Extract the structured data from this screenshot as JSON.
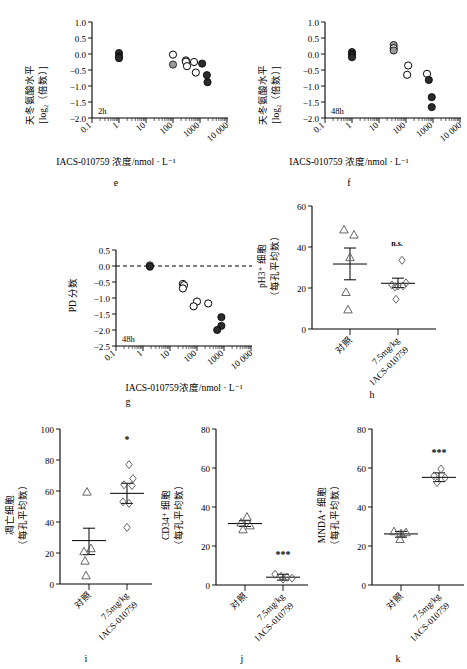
{
  "figure": {
    "panels": [
      "e",
      "f",
      "g",
      "h",
      "i",
      "j",
      "k"
    ]
  },
  "panel_e": {
    "letter": "e",
    "inline_label": "2h",
    "ylabel_line1": "天冬氨酸水平",
    "ylabel_line2": "[log₂（倍数）]",
    "xlabel": "IACS-010759 浓度/nmol · L⁻¹",
    "yticks": [
      "1.0",
      "0.5",
      "0.0",
      "−0.5",
      "−1.0",
      "−1.5",
      "−2.0"
    ],
    "xticks": [
      "0.1",
      "1",
      "10",
      "100",
      "1000",
      "10 000"
    ]
  },
  "panel_f": {
    "letter": "f",
    "inline_label": "48h",
    "ylabel_line1": "天冬氨酸水平",
    "ylabel_line2": "[log₂（倍数）]",
    "xlabel": "IACS-010759 浓度/nmol · L⁻¹",
    "yticks": [
      "1.0",
      "0.5",
      "0.0",
      "−0.5",
      "−1.0",
      "−1.5",
      "−2.0"
    ],
    "xticks": [
      "0.1",
      "1",
      "10",
      "100",
      "1000",
      "10 000"
    ]
  },
  "panel_g": {
    "letter": "g",
    "inline_label": "48h",
    "ylabel": "PD 分数",
    "xlabel": "IACS-010759浓度/nmol · L⁻¹",
    "yticks": [
      "0.5",
      "0.0",
      "−0.5",
      "−1.0",
      "−1.5",
      "−2.0",
      "−2.5"
    ],
    "xticks": [
      "0.1",
      "1",
      "10",
      "100",
      "1000",
      "10 000"
    ]
  },
  "panel_h": {
    "letter": "h",
    "ylabel_line1": "pH3⁺ 细胞",
    "ylabel_line2": "（每孔平均数）",
    "yticks": [
      "60",
      "40",
      "20",
      "0"
    ],
    "xticks": [
      "对照",
      "7.5mg/kg\nIACS-010759"
    ],
    "xtick1": "对照",
    "xtick2a": "7.5mg/kg",
    "xtick2b": "IACS-010759",
    "significance": "n.s."
  },
  "panel_i": {
    "letter": "i",
    "ylabel_line1": "凋亡细胞",
    "ylabel_line2": "（每孔平均数）",
    "yticks": [
      "100",
      "80",
      "60",
      "40",
      "20",
      "0"
    ],
    "xtick1": "对照",
    "xtick2a": "7.5mg/kg",
    "xtick2b": "IACS-010759",
    "significance": "*"
  },
  "panel_j": {
    "letter": "j",
    "ylabel_line1": "CD34⁺ 细胞",
    "ylabel_line2": "（每孔平均数）",
    "yticks": [
      "80",
      "60",
      "40",
      "20",
      "0"
    ],
    "xtick1": "对照",
    "xtick2a": "7.5mg/kg",
    "xtick2b": "IACS-010759",
    "significance": "***"
  },
  "panel_k": {
    "letter": "k",
    "ylabel_line1": "MNDA⁺ 细胞",
    "ylabel_line2": "（每孔平均数）",
    "yticks": [
      "80",
      "60",
      "40",
      "20",
      "0"
    ],
    "xtick1": "对照",
    "xtick2a": "7.5mg/kg",
    "xtick2b": "IACS-010759",
    "significance": "***"
  },
  "chart_data": [
    {
      "id": "e",
      "type": "scatter",
      "title": "",
      "xlabel": "IACS-010759 浓度/nmol · L⁻¹",
      "ylabel": "天冬氨酸水平 [log2(倍数)]",
      "annotation": "2h",
      "xscale": "log",
      "xlim": [
        0.1,
        10000
      ],
      "ylim": [
        -2.0,
        1.0
      ],
      "grid": false,
      "legend": "none",
      "points": [
        {
          "x": 1,
          "y": 0.03,
          "style": "dark"
        },
        {
          "x": 1,
          "y": -0.08,
          "style": "dark"
        },
        {
          "x": 1,
          "y": -0.13,
          "style": "dark"
        },
        {
          "x": 100,
          "y": -0.02,
          "style": "open"
        },
        {
          "x": 100,
          "y": -0.33,
          "style": "gray"
        },
        {
          "x": 300,
          "y": -0.2,
          "style": "open"
        },
        {
          "x": 300,
          "y": -0.24,
          "style": "open"
        },
        {
          "x": 330,
          "y": -0.38,
          "style": "open"
        },
        {
          "x": 600,
          "y": -0.25,
          "style": "open"
        },
        {
          "x": 700,
          "y": -0.58,
          "style": "open"
        },
        {
          "x": 1200,
          "y": -0.3,
          "style": "dark"
        },
        {
          "x": 1800,
          "y": -0.66,
          "style": "dark"
        },
        {
          "x": 1900,
          "y": -0.88,
          "style": "dark"
        }
      ]
    },
    {
      "id": "f",
      "type": "scatter",
      "title": "",
      "xlabel": "IACS-010759 浓度/nmol · L⁻¹",
      "ylabel": "天冬氨酸水平 [log2(倍数)]",
      "annotation": "48h",
      "xscale": "log",
      "xlim": [
        0.1,
        10000
      ],
      "ylim": [
        -2.0,
        1.0
      ],
      "grid": false,
      "legend": "none",
      "points": [
        {
          "x": 1,
          "y": 0.06,
          "style": "dark"
        },
        {
          "x": 1,
          "y": -0.02,
          "style": "dark"
        },
        {
          "x": 1,
          "y": -0.1,
          "style": "dark"
        },
        {
          "x": 35,
          "y": 0.28,
          "style": "gray"
        },
        {
          "x": 35,
          "y": 0.18,
          "style": "open"
        },
        {
          "x": 35,
          "y": 0.11,
          "style": "gray"
        },
        {
          "x": 120,
          "y": -0.36,
          "style": "open"
        },
        {
          "x": 110,
          "y": -0.65,
          "style": "open"
        },
        {
          "x": 600,
          "y": -0.62,
          "style": "open"
        },
        {
          "x": 700,
          "y": -0.81,
          "style": "dark"
        },
        {
          "x": 900,
          "y": -1.35,
          "style": "dark"
        },
        {
          "x": 900,
          "y": -1.66,
          "style": "dark"
        }
      ]
    },
    {
      "id": "g",
      "type": "scatter",
      "title": "",
      "xlabel": "IACS-010759浓度/nmol · L⁻¹",
      "ylabel": "PD 分数",
      "annotation": "48h",
      "xscale": "log",
      "xlim": [
        0.1,
        10000
      ],
      "ylim": [
        -2.5,
        0.5
      ],
      "grid": false,
      "reference_line": {
        "y": 0.0,
        "style": "dashed"
      },
      "legend": "none",
      "points": [
        {
          "x": 1.8,
          "y": 0.02,
          "style": "gray"
        },
        {
          "x": 1.8,
          "y": -0.02,
          "style": "dark"
        },
        {
          "x": 30,
          "y": -0.56,
          "style": "open"
        },
        {
          "x": 33,
          "y": -0.6,
          "style": "open"
        },
        {
          "x": 30,
          "y": -0.7,
          "style": "open"
        },
        {
          "x": 100,
          "y": -1.11,
          "style": "open"
        },
        {
          "x": 75,
          "y": -1.26,
          "style": "open"
        },
        {
          "x": 260,
          "y": -1.17,
          "style": "open"
        },
        {
          "x": 800,
          "y": -1.6,
          "style": "dark"
        },
        {
          "x": 800,
          "y": -1.87,
          "style": "dark"
        },
        {
          "x": 560,
          "y": -2.0,
          "style": "dark"
        }
      ]
    },
    {
      "id": "h",
      "type": "scatter",
      "ylabel": "pH3+ 细胞（每孔平均数）",
      "categories": [
        "对照",
        "7.5mg/kg IACS-010759"
      ],
      "ylim": [
        0,
        60
      ],
      "yticks": [
        0,
        20,
        40,
        60
      ],
      "grid": false,
      "annotation": "n.s.",
      "groups": [
        {
          "name": "对照",
          "marker": "triangle",
          "mean": 31.7,
          "sem_low": 24.0,
          "sem_high": 39.5,
          "values": [
            48.5,
            46.0,
            35.0,
            18.0,
            9.5
          ]
        },
        {
          "name": "7.5mg/kg IACS-010759",
          "marker": "diamond",
          "mean": 22.3,
          "sem_low": 20.2,
          "sem_high": 24.8,
          "values": [
            33.5,
            22.5,
            21.5,
            21.0,
            21.0,
            20.5,
            14.5
          ]
        }
      ]
    },
    {
      "id": "i",
      "type": "scatter",
      "ylabel": "凋亡细胞（每孔平均数）",
      "categories": [
        "对照",
        "7.5mg/kg IACS-010759"
      ],
      "ylim": [
        0,
        100
      ],
      "yticks": [
        0,
        20,
        40,
        60,
        80,
        100
      ],
      "grid": false,
      "annotation": "*",
      "groups": [
        {
          "name": "对照",
          "marker": "triangle",
          "mean": 28.0,
          "sem_low": 19.0,
          "sem_high": 36.0,
          "values": [
            59.5,
            23.0,
            21.0,
            15.0,
            5.5
          ]
        },
        {
          "name": "7.5mg/kg IACS-010759",
          "marker": "diamond",
          "mean": 58.5,
          "sem_low": 52.0,
          "sem_high": 65.0,
          "values": [
            77.0,
            68.0,
            64.0,
            63.5,
            53.0,
            52.0,
            36.5
          ]
        }
      ]
    },
    {
      "id": "j",
      "type": "scatter",
      "ylabel": "CD34+ 细胞（每孔平均数）",
      "categories": [
        "对照",
        "7.5mg/kg IACS-010759"
      ],
      "ylim": [
        0,
        80
      ],
      "yticks": [
        0,
        20,
        40,
        60,
        80
      ],
      "grid": false,
      "annotation": "***",
      "groups": [
        {
          "name": "对照",
          "marker": "triangle",
          "mean": 31.5,
          "sem_low": 30.0,
          "sem_high": 33.0,
          "values": [
            35.0,
            32.0,
            30.5,
            28.5
          ]
        },
        {
          "name": "7.5mg/kg IACS-010759",
          "marker": "diamond",
          "mean": 4.0,
          "sem_low": 2.5,
          "sem_high": 5.5,
          "values": [
            5.5,
            4.5,
            4.0,
            3.5,
            3.0
          ]
        }
      ]
    },
    {
      "id": "k",
      "type": "scatter",
      "ylabel": "MNDA+ 细胞（每孔平均数）",
      "categories": [
        "对照",
        "7.5mg/kg IACS-010759"
      ],
      "ylim": [
        0,
        80
      ],
      "yticks": [
        0,
        20,
        40,
        60,
        80
      ],
      "grid": false,
      "annotation": "***",
      "groups": [
        {
          "name": "对照",
          "marker": "triangle",
          "mean": 26.2,
          "sem_low": 24.5,
          "sem_high": 27.5,
          "values": [
            27.5,
            27.0,
            26.5,
            23.5
          ]
        },
        {
          "name": "7.5mg/kg IACS-010759",
          "marker": "diamond",
          "mean": 55.2,
          "sem_low": 53.0,
          "sem_high": 57.5,
          "values": [
            59.5,
            56.0,
            55.0,
            52.5
          ]
        }
      ]
    }
  ]
}
